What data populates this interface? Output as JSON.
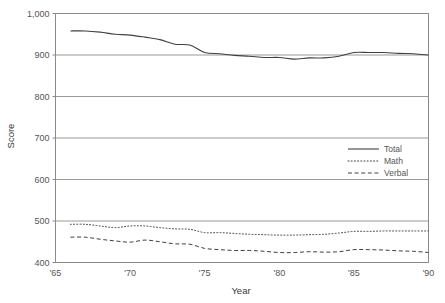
{
  "chart_data": {
    "type": "line",
    "title": "",
    "xlabel": "Year",
    "ylabel": "Score",
    "xlim": [
      1965,
      1990
    ],
    "ylim": [
      400,
      1000
    ],
    "grid": true,
    "grid_axis": "y",
    "legend_position": "center-right",
    "x_tick_labels": [
      "'65",
      "'70",
      "'75",
      "'80",
      "'85",
      "'90"
    ],
    "x_tick_values": [
      1965,
      1970,
      1975,
      1980,
      1985,
      1990
    ],
    "y_tick_labels": [
      "400",
      "500",
      "600",
      "700",
      "800",
      "900",
      "1,000"
    ],
    "y_tick_values": [
      400,
      500,
      600,
      700,
      800,
      900,
      1000
    ],
    "x": [
      1966,
      1967,
      1968,
      1969,
      1970,
      1971,
      1972,
      1973,
      1974,
      1975,
      1976,
      1977,
      1978,
      1979,
      1980,
      1981,
      1982,
      1983,
      1984,
      1985,
      1986,
      1987,
      1988,
      1989,
      1990
    ],
    "series": [
      {
        "name": "Total",
        "style": "solid",
        "color": "#404040",
        "values": [
          958,
          958,
          955,
          950,
          948,
          943,
          937,
          926,
          924,
          906,
          903,
          899,
          897,
          894,
          894,
          890,
          893,
          893,
          897,
          906,
          906,
          906,
          904,
          903,
          900
        ]
      },
      {
        "name": "Math",
        "style": "dotted",
        "color": "#404040",
        "values": [
          492,
          492,
          488,
          484,
          488,
          488,
          484,
          481,
          480,
          472,
          472,
          470,
          468,
          467,
          466,
          466,
          467,
          468,
          471,
          475,
          475,
          476,
          476,
          476,
          476
        ]
      },
      {
        "name": "Verbal",
        "style": "dashed",
        "color": "#404040",
        "values": [
          461,
          461,
          456,
          452,
          449,
          454,
          450,
          445,
          444,
          434,
          431,
          429,
          429,
          427,
          424,
          424,
          426,
          425,
          426,
          431,
          431,
          430,
          428,
          427,
          424
        ]
      }
    ],
    "legend_entries": [
      {
        "label": "Total",
        "style": "solid"
      },
      {
        "label": "Math",
        "style": "dotted"
      },
      {
        "label": "Verbal",
        "style": "dashed"
      }
    ],
    "colors": {
      "line": "#404040",
      "grid": "#999999",
      "axis": "#8a8a8a",
      "text": "#555555",
      "background": "#ffffff"
    }
  }
}
